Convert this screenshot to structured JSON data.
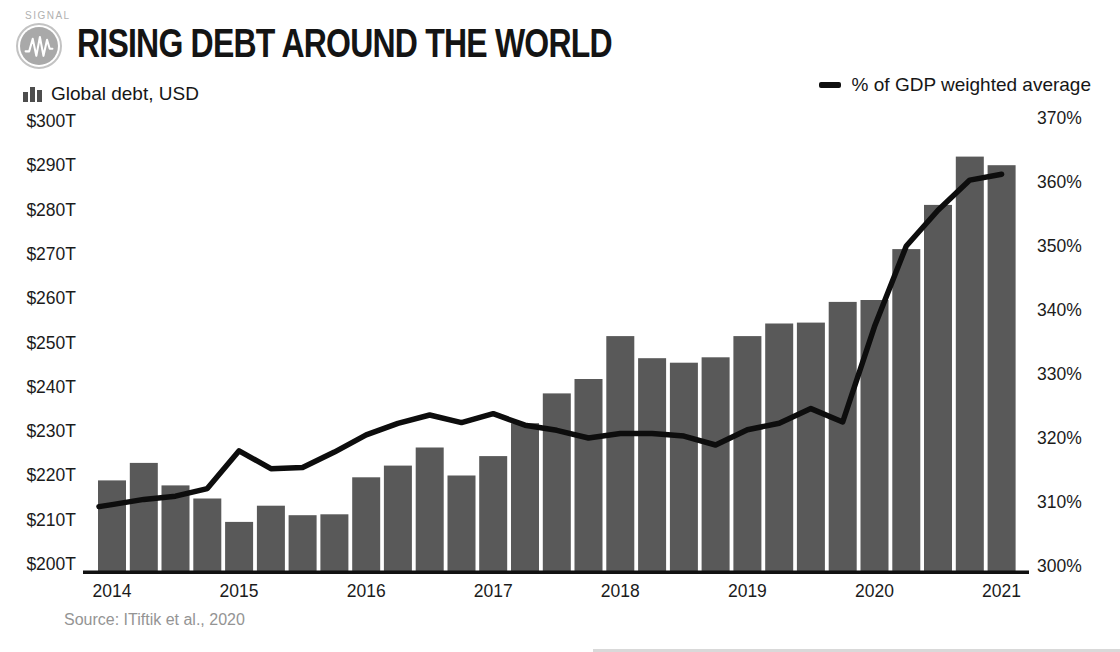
{
  "brand": {
    "wordmark": "SIGNAL",
    "logo_icon": "waveform-icon"
  },
  "title": "RISING DEBT AROUND THE WORLD",
  "series_labels": {
    "bars": "Global debt, USD",
    "line": "% of GDP weighted average"
  },
  "source_note": "Source: ITiftik et al., 2020",
  "colors": {
    "bar_fill": "#595959",
    "line_stroke": "#0d0d0d",
    "axis_text": "#1b1b1b",
    "baseline": "#111111",
    "muted_text": "#949494",
    "logo_gray": "#a9a9a9"
  },
  "chart_data": {
    "type": "bar",
    "subtype": "bar+line combo, quarterly",
    "title": "Rising debt around the world",
    "quarters": [
      "2014 Q1",
      "2014 Q2",
      "2014 Q3",
      "2014 Q4",
      "2015 Q1",
      "2015 Q2",
      "2015 Q3",
      "2015 Q4",
      "2016 Q1",
      "2016 Q2",
      "2016 Q3",
      "2016 Q4",
      "2017 Q1",
      "2017 Q2",
      "2017 Q3",
      "2017 Q4",
      "2018 Q1",
      "2018 Q2",
      "2018 Q3",
      "2018 Q4",
      "2019 Q1",
      "2019 Q2",
      "2019 Q3",
      "2019 Q4",
      "2020 Q1",
      "2020 Q2",
      "2020 Q3",
      "2020 Q4",
      "2021 Q1"
    ],
    "year_ticks": [
      "2014",
      "2015",
      "2016",
      "2017",
      "2018",
      "2019",
      "2020",
      "2021"
    ],
    "bars": {
      "name": "Global debt, USD",
      "unit": "USD trillions",
      "axis": "left",
      "values": [
        220.3,
        224.2,
        219.2,
        216.3,
        211.1,
        214.7,
        212.6,
        212.8,
        221.0,
        223.6,
        227.6,
        221.4,
        225.7,
        233.0,
        239.6,
        242.8,
        252.3,
        247.4,
        246.4,
        247.6,
        252.3,
        255.1,
        255.3,
        259.9,
        260.3,
        271.6,
        281.4,
        292.1,
        290.2
      ]
    },
    "line": {
      "name": "% of GDP weighted average",
      "unit": "percent of GDP",
      "axis": "right",
      "values": [
        309.6,
        310.4,
        310.9,
        312.1,
        318.0,
        315.2,
        315.4,
        317.8,
        320.5,
        322.3,
        323.6,
        322.4,
        323.8,
        322.0,
        321.2,
        320.0,
        320.7,
        320.7,
        320.3,
        318.9,
        321.3,
        322.3,
        324.6,
        322.5,
        337.4,
        350.0,
        355.6,
        360.3,
        361.2
      ]
    },
    "left_axis": {
      "min": 200,
      "max": 300,
      "tick_step": 10,
      "tick_labels": [
        "$300T",
        "$290T",
        "$280T",
        "$270T",
        "$260T",
        "$250T",
        "$240T",
        "$230T",
        "$220T",
        "$210T",
        "$200T"
      ]
    },
    "right_axis": {
      "min": 300,
      "max": 370,
      "tick_step": 10,
      "tick_labels": [
        "370%",
        "360%",
        "350%",
        "340%",
        "330%",
        "320%",
        "310%",
        "300%"
      ]
    },
    "grid": "none",
    "legend_position": "top"
  }
}
